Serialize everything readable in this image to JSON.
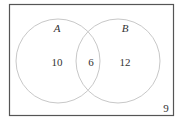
{
  "diagram": {
    "type": "venn",
    "universe": {
      "label_outside": "9"
    },
    "sets": [
      {
        "name": "A",
        "only_count": "10"
      },
      {
        "name": "B",
        "only_count": "12"
      }
    ],
    "intersection": {
      "count": "6"
    },
    "colors": {
      "border": "#555555",
      "circle": "#c8c8c8",
      "text": "#333333",
      "background": "#ffffff"
    }
  }
}
